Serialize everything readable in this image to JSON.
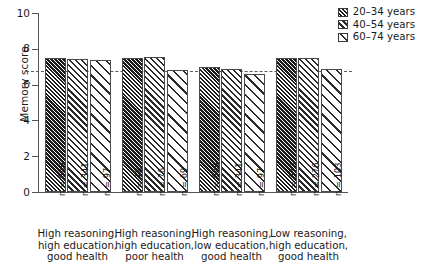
{
  "chart_data": {
    "type": "bar",
    "title": "",
    "xlabel": "",
    "ylabel": "Memory score",
    "ylim": [
      0,
      10
    ],
    "yticks": [
      0,
      2,
      4,
      6,
      8,
      10
    ],
    "grid": false,
    "legend_position": "top-right",
    "reference_line": 6.75,
    "categories": [
      "High reasoning, high education, good health",
      "High reasoning, high education, poor health",
      "High reasoning, low education, good health",
      "Low reasoning, high education, good health"
    ],
    "category_lines": [
      [
        "High reasoning,",
        "high education,",
        "good health"
      ],
      [
        "High reasoning,",
        "high education,",
        "poor health"
      ],
      [
        "High reasoning,",
        "low education,",
        "good health"
      ],
      [
        "Low reasoning,",
        "high education,",
        "good health"
      ]
    ],
    "series": [
      {
        "name": "20–34 years",
        "pattern": "hatch-dense",
        "values": [
          7.5,
          7.5,
          7.0,
          7.5
        ],
        "n": [
          669,
          78,
          669,
          573
        ]
      },
      {
        "name": "40–54 years",
        "pattern": "hatch-medium",
        "values": [
          7.45,
          7.55,
          6.9,
          7.5
        ],
        "n": [
          341,
          76,
          341,
          276
        ]
      },
      {
        "name": "60–74 years",
        "pattern": "hatch-sparse",
        "values": [
          7.4,
          6.8,
          6.6,
          6.85
        ],
        "n": [
          97,
          69,
          97,
          103
        ]
      }
    ],
    "n_labels": [
      [
        "n = 669",
        "n = 341",
        "n = 97"
      ],
      [
        "n = 78",
        "n = 76",
        "n = 69"
      ],
      [
        "n = 669",
        "n = 341",
        "n = 97"
      ],
      [
        "n = 573",
        "n = 276",
        "n = 103"
      ]
    ]
  },
  "legend": {
    "items": [
      {
        "label": "20–34 years",
        "pattern": "hatch-dense"
      },
      {
        "label": "40–54 years",
        "pattern": "hatch-medium"
      },
      {
        "label": "60–74 years",
        "pattern": "hatch-sparse"
      }
    ]
  },
  "axis": {
    "y_title": "Memory score",
    "y_tick_labels": [
      "10",
      "8",
      "6",
      "4",
      "2",
      "0"
    ]
  },
  "colors": {
    "axis": "#555555",
    "bar_outline": "#4a4a4a",
    "hatch_dark": "#1c1c1c",
    "hatch_line": "#2a2a2a",
    "reference_line": "#5a5a5a",
    "text": "#1a1a1a",
    "background": "#ffffff"
  }
}
